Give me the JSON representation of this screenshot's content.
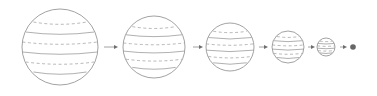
{
  "diagram": {
    "colors": {
      "background": "#ffffff",
      "outline": "#8a8a8a",
      "dot": "#666666"
    },
    "center_y": 47,
    "spheres": [
      {
        "id": 1,
        "cx": 60,
        "r": 38
      },
      {
        "id": 2,
        "cx": 154,
        "r": 31
      },
      {
        "id": 3,
        "cx": 230,
        "r": 24
      },
      {
        "id": 4,
        "cx": 288,
        "r": 16
      },
      {
        "id": 5,
        "cx": 326,
        "r": 9
      }
    ],
    "arrows": [
      {
        "x1": 104,
        "x2": 118
      },
      {
        "x1": 193,
        "x2": 203
      },
      {
        "x1": 259,
        "x2": 268
      },
      {
        "x1": 308,
        "x2": 315
      },
      {
        "x1": 340,
        "x2": 347
      }
    ],
    "final_dot": {
      "cx": 353,
      "r": 2.8
    }
  }
}
